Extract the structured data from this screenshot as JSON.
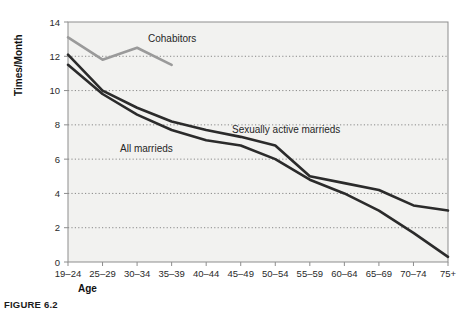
{
  "figure": {
    "caption": "FIGURE 6.2"
  },
  "chart_data": {
    "type": "line",
    "title": "",
    "xlabel": "Age",
    "ylabel": "Times/Month",
    "categories": [
      "19–24",
      "25–29",
      "30–34",
      "35–39",
      "40–44",
      "45–49",
      "50–54",
      "55–59",
      "60–64",
      "65–69",
      "70–74",
      "75+"
    ],
    "ylim": [
      0,
      14
    ],
    "yticks": [
      0,
      2,
      4,
      6,
      8,
      10,
      12,
      14
    ],
    "ytick_labels": [
      "0",
      "2",
      "4",
      "6",
      "8",
      "10",
      "12",
      "14"
    ],
    "grid": true,
    "grid_style": "dotted-horizontal",
    "legend": "inline-annotations",
    "series": [
      {
        "name": "Cohabitors",
        "color": "#9a9a9a",
        "label_x_category": "30–34",
        "values": [
          13.1,
          11.8,
          12.5,
          11.5,
          null,
          null,
          null,
          null,
          null,
          null,
          null,
          null
        ]
      },
      {
        "name": "Sexually active marrieds",
        "color": "#2b2b2b",
        "label_x_category": "45–49",
        "values": [
          12.1,
          10.0,
          9.0,
          8.2,
          7.7,
          7.3,
          6.8,
          5.0,
          4.6,
          4.2,
          3.3,
          3.0
        ]
      },
      {
        "name": "All marrieds",
        "color": "#2b2b2b",
        "label_x_category": "30–34",
        "values": [
          11.5,
          9.8,
          8.6,
          7.7,
          7.1,
          6.8,
          6.0,
          4.8,
          4.0,
          3.0,
          1.7,
          0.3
        ]
      }
    ]
  },
  "colors": {
    "plot_background": "#f2f2f0",
    "axis": "#8d8d8d",
    "grid": "#6f6f6f",
    "dark_series": "#2b2b2b",
    "light_series": "#9a9a9a",
    "page_background": "#ffffff"
  }
}
